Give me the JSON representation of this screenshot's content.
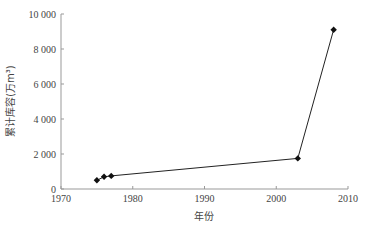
{
  "chart_data": {
    "type": "line",
    "title": "",
    "xlabel": "年份",
    "ylabel": "累计库容(万m³)",
    "xlim": [
      1970,
      2010
    ],
    "ylim": [
      0,
      10000
    ],
    "x_ticks": [
      1970,
      1980,
      1990,
      2000,
      2010
    ],
    "y_ticks": [
      0,
      2000,
      4000,
      6000,
      8000,
      10000
    ],
    "y_tick_labels": [
      "0",
      "2 000",
      "4 000",
      "6 000",
      "8 000",
      "10 000"
    ],
    "grid": false,
    "legend": null,
    "series": [
      {
        "name": "累计库容",
        "marker": "diamond",
        "color": "#111111",
        "x": [
          1975,
          1976,
          1977,
          2003,
          2008
        ],
        "values": [
          500,
          700,
          750,
          1750,
          9100
        ]
      }
    ]
  }
}
